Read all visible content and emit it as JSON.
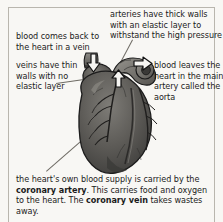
{
  "figure": {
    "background_color": "#f8f7f4",
    "text_color": "#1b1b1b",
    "rule_color": "#b9b6ae"
  },
  "labels": {
    "arteries": "arteries have thick walls with an elastic layer to withstand the high pressure",
    "vein_return": "blood comes back to the heart in a vein",
    "veins_walls": "veins have thin walls with no elastic layer",
    "aorta": "blood leaves the heart in the main artery called the aorta"
  },
  "coronary": {
    "part1": "the heart's own blood supply is carried by the ",
    "term1": "coronary artery",
    "part2": ". This carries food and oxygen to the heart. The ",
    "term2": "coronary vein",
    "part3": " takes wastes away."
  },
  "arrows": [
    {
      "name": "arrow-vein-in",
      "direction": "down",
      "meaning": "blood returning to the heart in a vein"
    },
    {
      "name": "arrow-aorta-out",
      "direction": "right",
      "meaning": "blood leaving the heart via the aorta"
    },
    {
      "name": "arrow-pulm-up",
      "direction": "up",
      "meaning": "blood leaving via the pulmonary artery"
    }
  ],
  "illustration": {
    "name": "heart-illustration",
    "description": "grayscale anatomical drawing of a human heart with coronary vessels",
    "fill_dark": "#4b4a48",
    "fill_mid": "#6a6864",
    "fill_light": "#8d8b86",
    "outline": "#1c1c1c"
  }
}
